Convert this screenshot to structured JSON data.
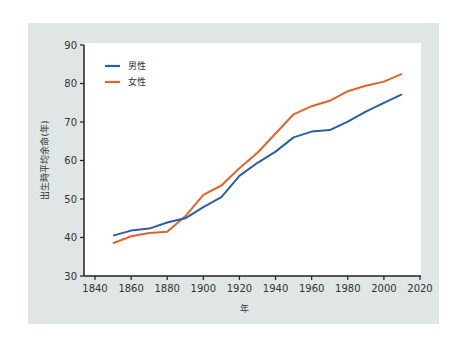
{
  "chart_data": {
    "type": "line",
    "title": "",
    "xlabel": "年",
    "ylabel": "出生時平均余命(年)",
    "xlim": [
      1840,
      2020
    ],
    "ylim": [
      30,
      90
    ],
    "xticks": [
      1840,
      1860,
      1880,
      1900,
      1920,
      1940,
      1960,
      1980,
      2000,
      2020
    ],
    "yticks": [
      30,
      40,
      50,
      60,
      70,
      80,
      90
    ],
    "grid": false,
    "legend_position": "top-left",
    "x": [
      1850,
      1860,
      1870,
      1880,
      1890,
      1900,
      1910,
      1920,
      1930,
      1940,
      1950,
      1960,
      1970,
      1980,
      1990,
      2000,
      2010
    ],
    "series": [
      {
        "name": "男性",
        "color": "#2b5fa3",
        "values": [
          40.5,
          41.8,
          42.3,
          43.9,
          45.0,
          47.9,
          50.5,
          56.0,
          59.4,
          62.3,
          66.0,
          67.5,
          67.9,
          70.1,
          72.7,
          75.0,
          77.2
        ]
      },
      {
        "name": "女性",
        "color": "#e0632a",
        "values": [
          38.5,
          40.3,
          41.2,
          41.5,
          45.5,
          51.1,
          53.5,
          58.0,
          62.0,
          67.0,
          72.0,
          74.1,
          75.5,
          78.0,
          79.4,
          80.5,
          82.5
        ]
      }
    ]
  }
}
